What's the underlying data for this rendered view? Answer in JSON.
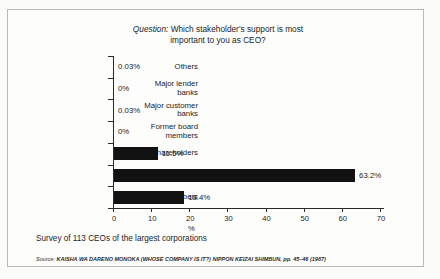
{
  "chart_data": {
    "type": "bar",
    "orientation": "horizontal",
    "title": "Question: Which stakeholder's support is most important to you as CEO?",
    "title_prefix": "Question:",
    "title_rest_line1": " Which stakeholder's support is most",
    "title_line2": "important to you as CEO?",
    "categories": [
      "Others",
      "Major lender banks",
      "Major customer banks",
      "Former board members",
      "Shareholders",
      "Employees",
      "Board members"
    ],
    "category_lines": [
      [
        "Others"
      ],
      [
        "Major lender",
        "banks"
      ],
      [
        "Major customer",
        "banks"
      ],
      [
        "Former board",
        "members"
      ],
      [
        "Shareholders"
      ],
      [
        "Employees"
      ],
      [
        "Board members"
      ]
    ],
    "values": [
      0.03,
      0,
      0.03,
      0,
      11.5,
      63.2,
      18.4
    ],
    "value_labels": [
      "0.03%",
      "0%",
      "0.03%",
      "0%",
      "11.5%",
      "63.2%",
      "18.4%"
    ],
    "xlabel": "%",
    "ylabel": "",
    "xlim": [
      0,
      70
    ],
    "xticks": [
      0,
      10,
      20,
      30,
      40,
      50,
      60,
      70
    ],
    "xtick_labels": [
      "0",
      "10",
      "20",
      "30",
      "40",
      "50",
      "60",
      "70"
    ],
    "grid": false,
    "legend": false,
    "bar_color": "#121212"
  },
  "footer": {
    "survey_note": "Survey of 113 CEOs of the largest corporations",
    "source_label": "Source:",
    "source_work": "KAISHA WA DARENO MONOKA",
    "source_rest": " (WHOSE COMPANY IS IT?) ",
    "source_publication": "NIPPON KEIZAI SHIMBUN",
    "source_pages": ", pp. 45–46 (1987)"
  }
}
